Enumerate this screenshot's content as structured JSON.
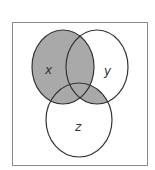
{
  "diagram": {
    "type": "venn",
    "sets": [
      {
        "id": "x",
        "label": "x",
        "cx": 63,
        "cy": 67,
        "rx": 31,
        "ry": 37
      },
      {
        "id": "y",
        "label": "y",
        "cx": 97,
        "cy": 67,
        "rx": 31,
        "ry": 37
      },
      {
        "id": "z",
        "label": "z",
        "cx": 79,
        "cy": 120,
        "rx": 33,
        "ry": 37
      }
    ],
    "shaded_region": "x ∪ (y ∩ z)",
    "colors": {
      "shade": "#a9a9a9",
      "stroke": "#333333",
      "frame": "#8a8a8a",
      "background": "#ffffff"
    }
  }
}
